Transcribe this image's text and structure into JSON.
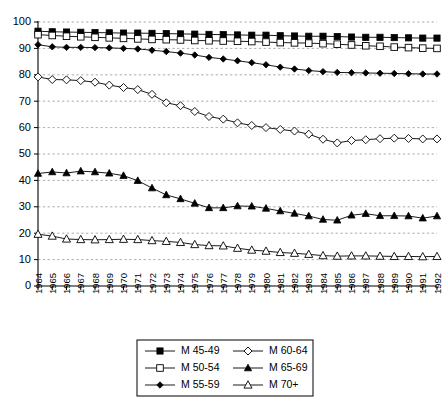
{
  "chart_data": {
    "type": "line",
    "title": "",
    "xlabel": "",
    "ylabel": "",
    "ylim": [
      0,
      100
    ],
    "ytick_step": 10,
    "grid": true,
    "legend_position": "bottom",
    "yticks": [
      "0",
      "10",
      "20",
      "30",
      "40",
      "50",
      "60",
      "70",
      "80",
      "90",
      "100"
    ],
    "categories": [
      "1964",
      "1965",
      "1966",
      "1967",
      "1968",
      "1969",
      "1970",
      "1971",
      "1972",
      "1973",
      "1974",
      "1975",
      "1976",
      "1977",
      "1978",
      "1979",
      "1980",
      "1981",
      "1982",
      "1983",
      "1984",
      "1985",
      "1986",
      "1987",
      "1988",
      "1989",
      "1990",
      "1991",
      "1992"
    ],
    "series": [
      {
        "name": "M 45-49",
        "marker": "filled-square",
        "values": [
          96.5,
          96.3,
          96.2,
          96.1,
          96.0,
          95.9,
          95.8,
          95.8,
          95.7,
          95.6,
          95.5,
          95.4,
          95.3,
          95.2,
          95.1,
          95.0,
          95.0,
          94.8,
          94.7,
          94.6,
          94.6,
          94.5,
          94.3,
          94.2,
          94.2,
          94.1,
          94.0,
          93.9,
          93.9
        ]
      },
      {
        "name": "M 50-54",
        "marker": "open-square",
        "values": [
          95.2,
          94.9,
          94.6,
          94.4,
          94.2,
          94.0,
          93.8,
          93.6,
          93.4,
          93.3,
          93.2,
          93.0,
          92.9,
          92.8,
          92.7,
          92.6,
          92.4,
          92.2,
          92.1,
          92.0,
          91.8,
          91.6,
          91.3,
          91.0,
          90.8,
          90.5,
          90.3,
          90.1,
          90.0
        ]
      },
      {
        "name": "M 55-59",
        "marker": "filled-diamond",
        "values": [
          91.4,
          90.6,
          90.4,
          90.4,
          90.3,
          90.2,
          90.0,
          89.8,
          89.3,
          88.8,
          88.2,
          87.5,
          86.6,
          86.0,
          85.3,
          84.6,
          83.8,
          82.9,
          82.2,
          81.6,
          81.2,
          80.9,
          80.8,
          80.7,
          80.6,
          80.5,
          80.4,
          80.3,
          80.3
        ]
      },
      {
        "name": "M 60-64",
        "marker": "open-diamond",
        "values": [
          79.2,
          78.2,
          78.1,
          77.8,
          77.2,
          76.1,
          75.2,
          74.4,
          72.6,
          69.4,
          68.3,
          66.1,
          64.2,
          63.2,
          61.8,
          60.8,
          60.0,
          59.3,
          58.7,
          57.5,
          55.6,
          54.2,
          55.1,
          55.4,
          55.8,
          56.0,
          55.9,
          55.7,
          55.7
        ]
      },
      {
        "name": "M 65-69",
        "marker": "filled-triangle",
        "values": [
          42.6,
          43.2,
          42.8,
          43.5,
          43.2,
          42.7,
          41.8,
          39.9,
          37.1,
          34.5,
          33.0,
          31.3,
          29.6,
          29.6,
          30.3,
          30.2,
          29.4,
          28.4,
          27.5,
          26.5,
          25.2,
          24.9,
          26.8,
          27.4,
          26.6,
          26.6,
          26.5,
          25.7,
          26.5
        ]
      },
      {
        "name": "M 70+",
        "marker": "open-triangle",
        "values": [
          19.6,
          18.9,
          17.8,
          17.6,
          17.5,
          17.6,
          17.7,
          17.6,
          17.2,
          16.9,
          16.5,
          15.7,
          15.3,
          15.2,
          14.3,
          13.6,
          13.2,
          12.7,
          12.4,
          12.0,
          11.5,
          11.3,
          11.4,
          11.4,
          11.3,
          11.2,
          11.2,
          11.1,
          11.2
        ]
      }
    ],
    "legend": [
      {
        "label": "M 45-49",
        "marker": "filled-square"
      },
      {
        "label": "M 60-64",
        "marker": "open-diamond"
      },
      {
        "label": "M 50-54",
        "marker": "open-square"
      },
      {
        "label": "M 65-69",
        "marker": "filled-triangle"
      },
      {
        "label": "M 55-59",
        "marker": "filled-diamond"
      },
      {
        "label": "M 70+",
        "marker": "open-triangle"
      }
    ]
  }
}
